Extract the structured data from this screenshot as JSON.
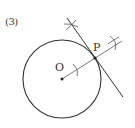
{
  "problem": {
    "number_label": "(3)"
  },
  "diagram": {
    "type": "geometric-construction",
    "points": {
      "center_label": "O",
      "tangent_point_label": "P"
    },
    "colors": {
      "stroke": "#333333",
      "construction": "#666666",
      "background": "#ffffff"
    }
  }
}
